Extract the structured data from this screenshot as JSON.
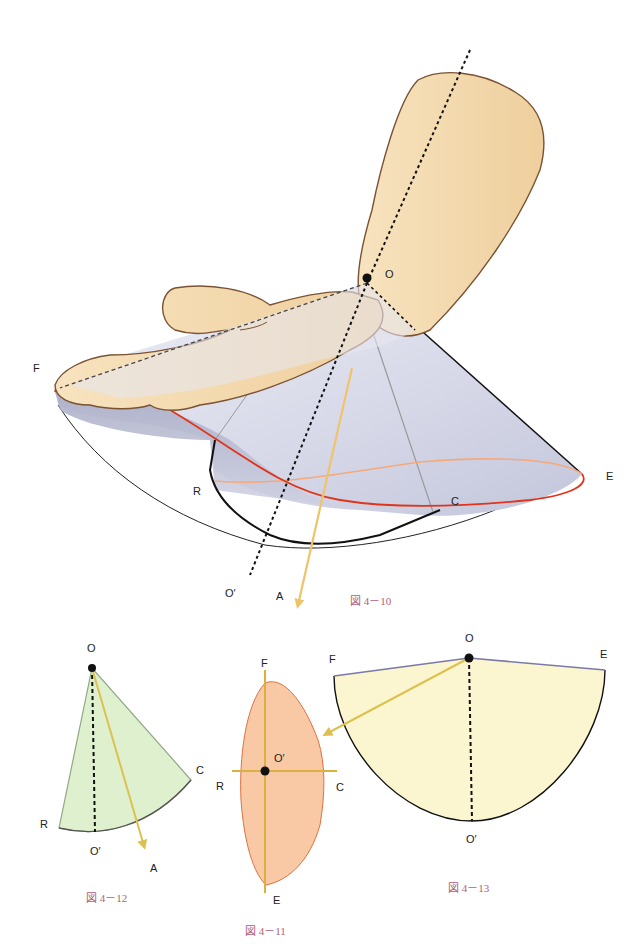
{
  "figures": {
    "fig_4_10": {
      "caption": "図 4－10",
      "description": "Hand with wrist circumduction cone; apex at wrist O, axis O–O′ extended, resultant vector A",
      "labels": {
        "O": "O",
        "F": "F",
        "E": "E",
        "R": "R",
        "C": "C",
        "O_prime": "O′",
        "A": "A"
      }
    },
    "fig_4_11": {
      "caption": "図 4－11",
      "description": "Cone base cross-section (orange oval) with F–E and R–C axes crossing at O′",
      "labels": {
        "F": "F",
        "E": "E",
        "R": "R",
        "C": "C",
        "O_prime": "O′"
      }
    },
    "fig_4_12": {
      "caption": "図 4－12",
      "description": "Green sector R–O–C with axis O–O′ (dashed) and vector A",
      "labels": {
        "O": "O",
        "R": "R",
        "C": "C",
        "O_prime": "O′",
        "A": "A"
      }
    },
    "fig_4_13": {
      "caption": "図 4－13",
      "description": "Yellow semicircular sector F–O–E with axis O–O′ (dashed) and arrow pointing to Fig 4-11",
      "labels": {
        "O": "O",
        "F": "F",
        "E": "E",
        "O_prime": "O′"
      }
    }
  },
  "colors": {
    "skin": "#f3d9ad",
    "skin_outline": "#7a5234",
    "cone_fill": "#d7d9e8",
    "cone_shadow": "#8f93ad",
    "red_rim": "#e0341c",
    "orange_rim": "#f4a97c",
    "arrow_yellow": "#f0c36a",
    "green_fill": "#dff0cf",
    "green_outline": "#8fa884",
    "oval_fill": "#f8c9a4",
    "oval_outline": "#e0703f",
    "axis_gold": "#dcb03e",
    "semi_fill": "#fbf6cf",
    "semi_edge": "#7a7aa8",
    "caption": "#b0607a"
  }
}
